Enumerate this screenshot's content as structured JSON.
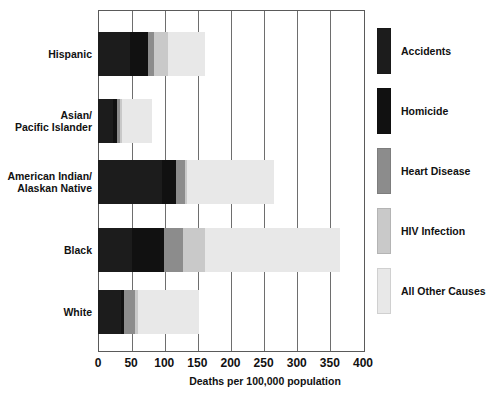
{
  "chart_data": {
    "type": "bar",
    "orientation": "horizontal",
    "stacked": true,
    "title": "",
    "xlabel": "Deaths per 100,000 population",
    "ylabel": "",
    "xlim": [
      0,
      400
    ],
    "xticks": [
      0,
      50,
      100,
      150,
      200,
      250,
      300,
      350,
      400
    ],
    "xtick_labels": [
      "0",
      "50",
      "100",
      "150",
      "200",
      "250",
      "300",
      "350",
      "400"
    ],
    "grid": true,
    "grid_axis": "x",
    "legend_position": "right",
    "categories": [
      "Hispanic",
      "Asian/\nPacific Islander",
      "American Indian/\nAlaskan Native",
      "Black",
      "White"
    ],
    "series": [
      {
        "name": "Accidents",
        "color": "#1c1c1c",
        "values": [
          48,
          22,
          97,
          52,
          34
        ]
      },
      {
        "name": "Homicide",
        "color": "#111111",
        "values": [
          28,
          6,
          21,
          48,
          5
        ]
      },
      {
        "name": "Heart Disease",
        "color": "#8c8c8c",
        "values": [
          8,
          5,
          13,
          28,
          17
        ]
      },
      {
        "name": "HIV Infection",
        "color": "#c9c9c9",
        "values": [
          22,
          3,
          4,
          33,
          5
        ]
      },
      {
        "name": "All Other Causes",
        "color": "#e8e8e8",
        "values": [
          55,
          46,
          130,
          204,
          92
        ]
      }
    ],
    "totals": [
      161,
      82,
      265,
      365,
      153
    ]
  },
  "legend": {
    "items": [
      {
        "label": "Accidents",
        "color": "#1c1c1c"
      },
      {
        "label": "Homicide",
        "color": "#111111"
      },
      {
        "label": "Heart Disease",
        "color": "#8c8c8c"
      },
      {
        "label": "HIV Infection",
        "color": "#c9c9c9"
      },
      {
        "label": "All Other Causes",
        "color": "#e8e8e8"
      }
    ]
  },
  "axis": {
    "title": "Deaths per 100,000 population",
    "ticks": [
      "0",
      "50",
      "100",
      "150",
      "200",
      "250",
      "300",
      "350",
      "400"
    ]
  },
  "categories": {
    "labels": [
      "Hispanic",
      "Asian/\nPacific Islander",
      "American Indian/\nAlaskan Native",
      "Black",
      "White"
    ]
  }
}
